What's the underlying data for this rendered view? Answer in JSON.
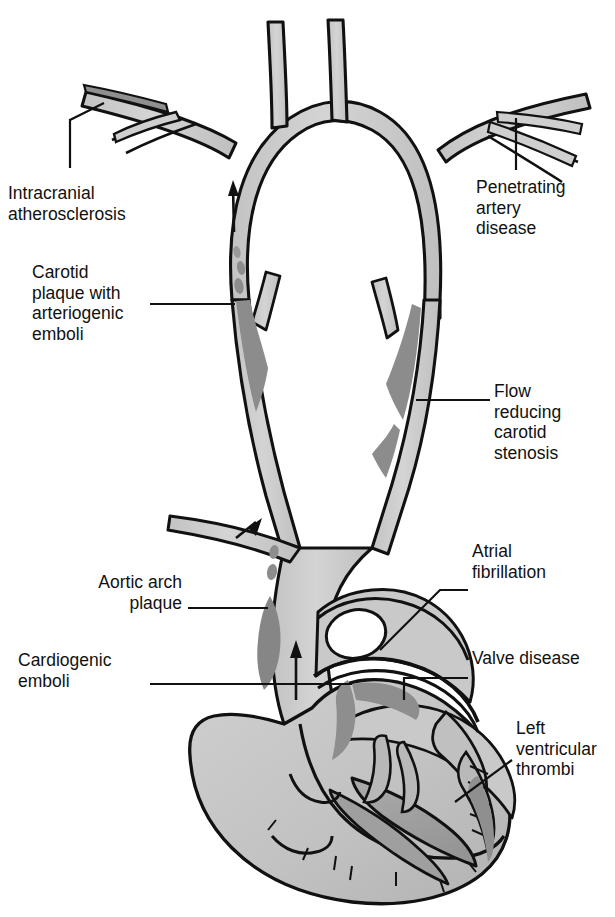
{
  "figure": {
    "type": "medical-anatomical-diagram",
    "colorscheme": "grayscale",
    "colors": {
      "background": "#ffffff",
      "outline": "#111111",
      "vessel_fill": "#cdcdcd",
      "vessel_fill_light": "#d8d8d8",
      "plaque_dark": "#8a8a8a",
      "plaque_darker": "#777777",
      "heart_fill": "#c4c4c4",
      "chamber_dark": "#a6a6a6",
      "chamber_darker": "#9a9a9a",
      "leader_line": "#111111"
    }
  },
  "labels": [
    {
      "id": "intracranial-atherosclerosis",
      "text": "Intracranial\natherosclerosis",
      "align": "left",
      "x": 8,
      "y": 183,
      "leader": "vertical-up"
    },
    {
      "id": "carotid-plaque",
      "text": "Carotid\nplaque with\narteriogenic\nemboli",
      "align": "left",
      "x": 32,
      "y": 262,
      "leader": "horizontal-right"
    },
    {
      "id": "aortic-arch-plaque",
      "text": "Aortic arch\nplaque",
      "align": "right",
      "x": 112,
      "y": 572,
      "leader": "horizontal-right"
    },
    {
      "id": "cardiogenic-emboli",
      "text": "Cardiogenic\nemboli",
      "align": "left",
      "x": 18,
      "y": 650,
      "leader": "horizontal-right"
    },
    {
      "id": "penetrating-artery-disease",
      "text": "Penetrating\nartery\ndisease",
      "align": "left",
      "x": 476,
      "y": 177,
      "leader": "vertical-up"
    },
    {
      "id": "flow-reducing-carotid-stenosis",
      "text": "Flow\nreducing\ncarotid\nstenosis",
      "align": "left",
      "x": 494,
      "y": 381,
      "leader": "horizontal-left"
    },
    {
      "id": "atrial-fibrillation",
      "text": "Atrial\nfibrillation",
      "align": "left",
      "x": 472,
      "y": 541,
      "leader": "diagonal-left"
    },
    {
      "id": "valve-disease",
      "text": "Valve disease",
      "align": "left",
      "x": 472,
      "y": 648,
      "leader": "horizontal-left"
    },
    {
      "id": "left-ventricular-thrombi",
      "text": "Left\nventricular\nthrombi",
      "align": "left",
      "x": 516,
      "y": 718,
      "leader": "diagonal-left"
    }
  ],
  "anatomy": [
    {
      "id": "circle-of-willis",
      "name": "cerebral arterial arch"
    },
    {
      "id": "left-intracranial-branch",
      "name": "intracranial branch with stenosis"
    },
    {
      "id": "right-penetrating-branches",
      "name": "penetrating arteries"
    },
    {
      "id": "left-carotid",
      "name": "left carotid artery with bifurcation plaque"
    },
    {
      "id": "right-carotid",
      "name": "right carotid artery with stenosis"
    },
    {
      "id": "aortic-arch",
      "name": "aortic arch with plaque"
    },
    {
      "id": "heart",
      "name": "heart cross-section"
    },
    {
      "id": "left-atrium",
      "name": "left atrium"
    },
    {
      "id": "left-ventricle",
      "name": "left ventricle with mural thrombi"
    },
    {
      "id": "mitral-valve",
      "name": "valve leaflets"
    },
    {
      "id": "cardiogenic-embolus",
      "name": "cardiogenic embolus blob"
    }
  ],
  "flow_arrows": [
    {
      "id": "arrow-left-carotid-up",
      "direction": "up"
    },
    {
      "id": "arrow-aortic-branch-up",
      "direction": "up"
    },
    {
      "id": "arrow-ascending-aorta-up",
      "direction": "up"
    }
  ]
}
